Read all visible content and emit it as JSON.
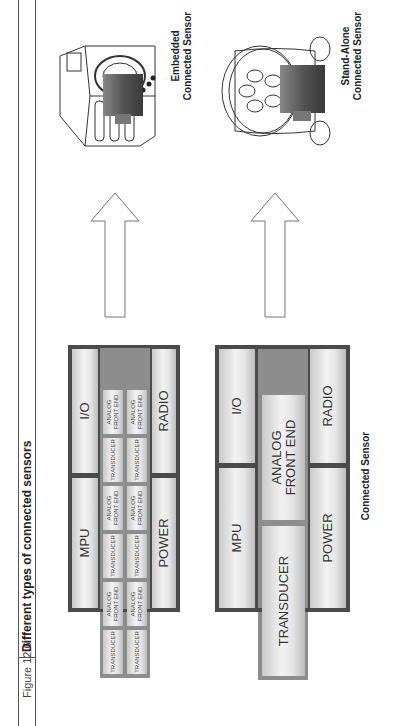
{
  "figure": {
    "number": "Figure 12.6",
    "title": "Different types of connected sensors"
  },
  "top_block": {
    "mpu": "MPU",
    "io": "I/O",
    "power": "POWER",
    "radio": "RADIO",
    "transducer": "TRANSDUCER",
    "afe_line1": "ANALOG",
    "afe_line2": "FRONT END"
  },
  "bottom_block": {
    "mpu": "MPU",
    "io": "I/O",
    "power": "POWER",
    "radio": "RADIO",
    "transducer": "TRANSDUCER",
    "afe_line1": "ANALOG",
    "afe_line2": "FRONT END",
    "caption": "Connected Sensor"
  },
  "devices": {
    "embedded": {
      "line1": "Embedded",
      "line2": "Connected Sensor"
    },
    "standalone": {
      "line1": "Stand-Alone",
      "line2": "Connected Sensor"
    }
  },
  "colors": {
    "block_border": "#4a4a4a",
    "cell_fill": "#f2f2f2",
    "module_dark": "#555555"
  }
}
